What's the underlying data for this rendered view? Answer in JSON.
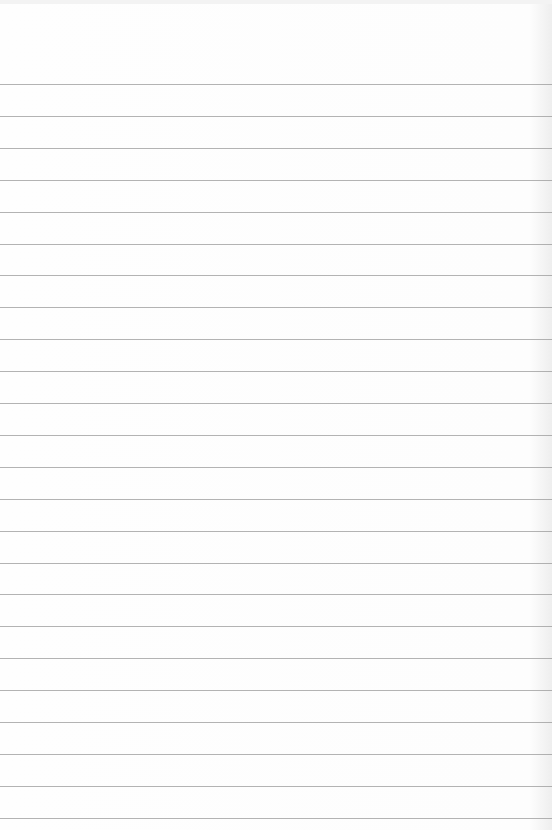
{
  "page": {
    "type": "blank lined notebook paper",
    "background_color": "#fdfdfd",
    "rule_color": "#9a9a9a",
    "rule_count": 24,
    "first_rule_y": 84,
    "rule_spacing": 31.9,
    "text": ""
  }
}
